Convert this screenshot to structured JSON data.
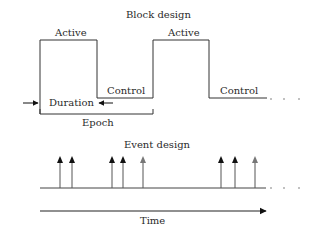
{
  "block_design": {
    "title": "Block design",
    "labels": {
      "active_1": "Active",
      "active_2": "Active",
      "control_1": "Control",
      "control_2": "Control",
      "duration": "Duration",
      "epoch": "Epoch"
    },
    "continuation": ". . ."
  },
  "event_design": {
    "title": "Event design",
    "events": [
      {
        "x": 60,
        "color": "#111111"
      },
      {
        "x": 72,
        "color": "#111111"
      },
      {
        "x": 112,
        "color": "#111111"
      },
      {
        "x": 123,
        "color": "#111111"
      },
      {
        "x": 143,
        "color": "#777777"
      },
      {
        "x": 221,
        "color": "#111111"
      },
      {
        "x": 235,
        "color": "#111111"
      },
      {
        "x": 255,
        "color": "#777777"
      }
    ],
    "continuation": ". . ."
  },
  "time_axis": {
    "label": "Time"
  },
  "colors": {
    "line": "#333333",
    "event_dark": "#111111",
    "event_gray": "#777777"
  }
}
